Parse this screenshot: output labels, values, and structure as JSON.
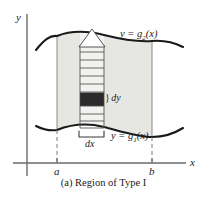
{
  "figure": {
    "caption": "(a) Region of Type I",
    "axes": {
      "y_label": "y",
      "x_label": "x",
      "x_ticks": [
        {
          "label": "a",
          "x": 57
        },
        {
          "label": "b",
          "x": 152
        }
      ],
      "x_axis_y": 163,
      "y_axis_x": 27
    },
    "curves": [
      {
        "name": "upper-curve",
        "label_prefix": "y = g",
        "label_sub": "2",
        "label_suffix": "(x)",
        "label_full": "y = g2(x)"
      },
      {
        "name": "lower-curve",
        "label_prefix": "y = g",
        "label_sub": "1",
        "label_suffix": "(x)",
        "label_full": "y = g1(x)"
      }
    ],
    "annotations": {
      "dy": "} dy",
      "dy_text": "dy",
      "dx": "dx"
    },
    "colors": {
      "region_fill": "#e6e6e3",
      "strip_fill": "#f0f0ee",
      "curve_stroke": "#1a1a1a",
      "axis_stroke": "#6b6b6b",
      "dark_cell": "#2b2b2b",
      "text": "#1a1a1a",
      "background": "#ffffff"
    },
    "strip": {
      "left_x": 80,
      "right_x": 104,
      "rung_count": 11,
      "dark_cell_index": 7
    }
  }
}
